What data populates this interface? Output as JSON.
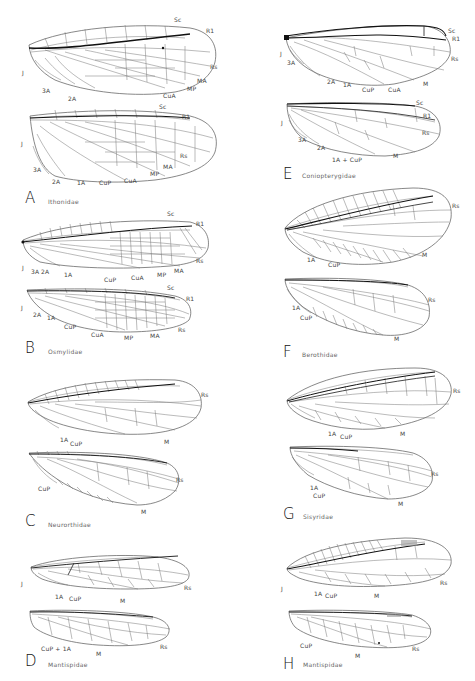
{
  "figure": {
    "panels": [
      {
        "letter": "A",
        "family": "Ithonidae",
        "forewing": {
          "labels": [
            "Sc",
            "R1",
            "Rs",
            "MA",
            "MP",
            "CuA",
            "2A",
            "3A",
            "J"
          ]
        },
        "hindwing": {
          "labels": [
            "Sc",
            "R1",
            "Rs",
            "MA",
            "MP",
            "CuA",
            "CuP",
            "1A",
            "2A",
            "3A",
            "J"
          ]
        }
      },
      {
        "letter": "B",
        "family": "Osmylidae",
        "forewing": {
          "labels": [
            "Sc",
            "R1",
            "Rs",
            "MA",
            "MP",
            "CuA",
            "CuP",
            "1A",
            "2A",
            "3A",
            "J"
          ]
        },
        "hindwing": {
          "labels": [
            "Sc",
            "R1",
            "Rs",
            "MA",
            "MP",
            "CuA",
            "CuP",
            "1A",
            "2A",
            "J"
          ]
        }
      },
      {
        "letter": "C",
        "family": "Neurorthidae",
        "forewing": {
          "labels": [
            "Rs",
            "M",
            "CuP",
            "1A"
          ]
        },
        "hindwing": {
          "labels": [
            "Rs",
            "M",
            "CuP"
          ]
        }
      },
      {
        "letter": "D",
        "family": "Mantispidae",
        "forewing": {
          "labels": [
            "Rs",
            "M",
            "CuP",
            "1A",
            "J"
          ]
        },
        "hindwing": {
          "labels": [
            "Rs",
            "M",
            "CuP + 1A"
          ]
        }
      },
      {
        "letter": "E",
        "family": "Coniopterygidae",
        "forewing": {
          "labels": [
            "Sc",
            "R1",
            "Rs",
            "M",
            "CuA",
            "CuP",
            "1A",
            "2A",
            "3A",
            "J"
          ]
        },
        "hindwing": {
          "labels": [
            "Sc",
            "R1",
            "Rs",
            "M",
            "1A + CuP",
            "2A",
            "3A",
            "J"
          ]
        }
      },
      {
        "letter": "F",
        "family": "Berothidae",
        "forewing": {
          "labels": [
            "Rs",
            "M",
            "CuP",
            "1A"
          ]
        },
        "hindwing": {
          "labels": [
            "Rs",
            "M",
            "CuP",
            "1A"
          ]
        }
      },
      {
        "letter": "G",
        "family": "Sisyridae",
        "forewing": {
          "labels": [
            "Rs",
            "M",
            "CuP",
            "1A"
          ]
        },
        "hindwing": {
          "labels": [
            "Rs",
            "M",
            "CuP",
            "1A"
          ]
        }
      },
      {
        "letter": "H",
        "family": "Mantispidae",
        "forewing": {
          "labels": [
            "Rs",
            "M",
            "CuP",
            "1A",
            "J"
          ]
        },
        "hindwing": {
          "labels": [
            "Rs",
            "M",
            "CuP"
          ]
        }
      }
    ]
  }
}
